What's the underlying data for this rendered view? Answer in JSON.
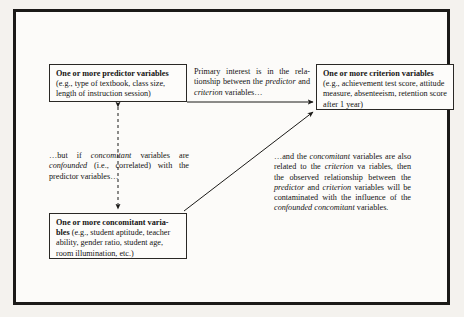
{
  "figure": {
    "caption_present": false,
    "boxes": {
      "predictor": {
        "heading": "One or more predictor variables",
        "body": "(e.g., type of textbook, class size, length of instruction session)"
      },
      "criterion": {
        "heading": "One or more criterion variables",
        "body": "(e.g., achievement test score, attitude measure, absenteeism, retention score after 1 year)"
      },
      "concomitant": {
        "heading": "One or more concomitant varia-",
        "heading_cont": "bles",
        "body": "(e.g., student aptitude, teacher ability, gender ratio, student age, room illumination, etc.)"
      }
    },
    "notes": {
      "primary_interest": {
        "part1": "Primary interest is in the rela-tionship between the ",
        "em1": "predictor",
        "part2": " and ",
        "em2": "criterion",
        "part3": " variables…"
      },
      "but_if": {
        "part1": "…but if ",
        "em1": "concomitant",
        "part2": " variables are ",
        "em2": "confounded",
        "part3": " (i.e., correlated) with the predictor variables…"
      },
      "and_the": {
        "part1": "…and the ",
        "em1": "concomitant",
        "part2": " variables are also related to the ",
        "em2": "criterion",
        "part3": " va riables, then the observed relationship between the ",
        "em3": "predictor",
        "part4": " and ",
        "em4": "criterion",
        "part5": " variables will be contaminated with the influence of the ",
        "em5": "confounded concomitant",
        "part6": " variables."
      }
    },
    "connectors": {
      "predictor_to_concomitant": "vertical-dashed-double-arrow",
      "predictor_to_criterion": "horizontal-solid-arrow",
      "concomitant_to_criterion": "diagonal-solid-arrow"
    },
    "colors": {
      "ink": "#141312",
      "frame": "#1b1a18",
      "page": "#fcfbf9",
      "backdrop": "#f4f2ee"
    }
  }
}
